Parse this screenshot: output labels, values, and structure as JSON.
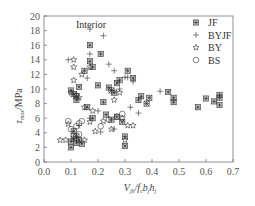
{
  "chart_data": {
    "type": "scatter",
    "title": "",
    "annotation": "Interior",
    "xlabel": "V_jh / f_c b_j h_j",
    "ylabel": "τ_max / MPa",
    "xlim": [
      0.0,
      0.7
    ],
    "ylim": [
      0,
      20
    ],
    "xticks": [
      "0.0",
      "0.1",
      "0.2",
      "0.3",
      "0.4",
      "0.5",
      "0.6",
      "0.7"
    ],
    "yticks": [
      "0",
      "2",
      "4",
      "6",
      "8",
      "10",
      "12",
      "14",
      "16",
      "18",
      "20"
    ],
    "grid": false,
    "legend_position": "upper right",
    "series": [
      {
        "name": "JF",
        "marker": "asterisk-box",
        "points": [
          [
            0.1,
            2.0
          ],
          [
            0.1,
            2.8
          ],
          [
            0.11,
            3.2
          ],
          [
            0.12,
            2.6
          ],
          [
            0.12,
            3.5
          ],
          [
            0.11,
            4.2
          ],
          [
            0.13,
            3.0
          ],
          [
            0.14,
            2.5
          ],
          [
            0.1,
            9.8
          ],
          [
            0.11,
            9.3
          ],
          [
            0.12,
            9.0
          ],
          [
            0.12,
            8.5
          ],
          [
            0.13,
            10.3
          ],
          [
            0.15,
            12.5
          ],
          [
            0.17,
            16.0
          ],
          [
            0.17,
            13.8
          ],
          [
            0.18,
            13.0
          ],
          [
            0.21,
            14.8
          ],
          [
            0.2,
            10.5
          ],
          [
            0.16,
            7.5
          ],
          [
            0.18,
            6.0
          ],
          [
            0.22,
            8.2
          ],
          [
            0.24,
            10.2
          ],
          [
            0.25,
            9.8
          ],
          [
            0.26,
            9.5
          ],
          [
            0.27,
            10.8
          ],
          [
            0.28,
            11.2
          ],
          [
            0.23,
            6.5
          ],
          [
            0.25,
            5.8
          ],
          [
            0.27,
            6.2
          ],
          [
            0.29,
            5.5
          ],
          [
            0.3,
            3.5
          ],
          [
            0.3,
            2.2
          ],
          [
            0.31,
            12.5
          ],
          [
            0.33,
            11.5
          ],
          [
            0.35,
            8.5
          ],
          [
            0.36,
            9.0
          ],
          [
            0.38,
            8.0
          ],
          [
            0.39,
            8.8
          ],
          [
            0.48,
            8.8
          ],
          [
            0.48,
            8.2
          ],
          [
            0.46,
            9.6
          ],
          [
            0.57,
            7.5
          ],
          [
            0.6,
            8.7
          ],
          [
            0.63,
            8.3
          ],
          [
            0.65,
            9.2
          ],
          [
            0.65,
            8.8
          ],
          [
            0.65,
            7.8
          ]
        ]
      },
      {
        "name": "BYJF",
        "marker": "plus",
        "points": [
          [
            0.09,
            14.0
          ],
          [
            0.16,
            11.5
          ],
          [
            0.17,
            18.2
          ],
          [
            0.17,
            14.8
          ],
          [
            0.22,
            17.3
          ],
          [
            0.24,
            13.4
          ],
          [
            0.26,
            12.5
          ],
          [
            0.28,
            10.0
          ],
          [
            0.3,
            11.6
          ],
          [
            0.31,
            11.6
          ],
          [
            0.2,
            7.0
          ],
          [
            0.13,
            5.0
          ],
          [
            0.17,
            6.0
          ],
          [
            0.21,
            4.1
          ],
          [
            0.26,
            4.5
          ],
          [
            0.33,
            11.0
          ],
          [
            0.35,
            6.7
          ],
          [
            0.43,
            9.7
          ],
          [
            0.32,
            7.5
          ]
        ]
      },
      {
        "name": "BY",
        "marker": "star",
        "points": [
          [
            0.11,
            14.0
          ],
          [
            0.11,
            13.0
          ],
          [
            0.11,
            11.2
          ],
          [
            0.14,
            12.0
          ],
          [
            0.17,
            13.0
          ],
          [
            0.1,
            9.5
          ],
          [
            0.12,
            9.2
          ],
          [
            0.13,
            8.8
          ],
          [
            0.15,
            7.5
          ],
          [
            0.18,
            7.0
          ],
          [
            0.06,
            3.0
          ],
          [
            0.08,
            3.0
          ],
          [
            0.09,
            5.2
          ],
          [
            0.15,
            3.0
          ],
          [
            0.19,
            4.2
          ],
          [
            0.17,
            5.5
          ],
          [
            0.25,
            4.5
          ],
          [
            0.22,
            5.6
          ],
          [
            0.29,
            6.0
          ],
          [
            0.31,
            5.0
          ],
          [
            0.33,
            5.0
          ],
          [
            0.28,
            9.5
          ],
          [
            0.26,
            8.5
          ],
          [
            0.3,
            3.0
          ]
        ]
      },
      {
        "name": "BS",
        "marker": "circle",
        "points": [
          [
            0.1,
            4.5
          ],
          [
            0.12,
            4.9
          ],
          [
            0.13,
            5.3
          ],
          [
            0.13,
            3.8
          ],
          [
            0.11,
            3.6
          ],
          [
            0.09,
            5.6
          ],
          [
            0.14,
            5.6
          ],
          [
            0.24,
            5.8
          ],
          [
            0.27,
            6.2
          ],
          [
            0.29,
            6.6
          ],
          [
            0.21,
            4.9
          ]
        ]
      }
    ]
  },
  "legend": {
    "annotation": "Interior",
    "items": [
      {
        "label": "JF",
        "symbol": "✳"
      },
      {
        "label": "BYJF",
        "symbol": "+"
      },
      {
        "label": "BY",
        "symbol": "☆"
      },
      {
        "label": "BS",
        "symbol": "○"
      }
    ]
  },
  "axes": {
    "y_label_main": "τ",
    "y_label_sub": "max",
    "y_label_unit": "/MPa",
    "x_label_main": "V",
    "x_label_sub1": "jh",
    "x_label_mid": "/f",
    "x_label_sub2": "c",
    "x_label_b": "b",
    "x_label_sub3": "j",
    "x_label_h": "h",
    "x_label_sub4": "j"
  },
  "colors": {
    "marker": "#333333",
    "axis": "#666666",
    "text": "#444444"
  }
}
